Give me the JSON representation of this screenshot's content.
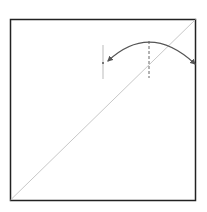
{
  "diagram": {
    "frame": {
      "x": 10.5,
      "y": 19.5,
      "width": 185,
      "height": 181,
      "stroke": "#222222"
    },
    "diagonal": {
      "x1": 10.5,
      "y1": 200,
      "x2": 195.5,
      "y2": 19.5,
      "stroke": "#c8c8c8"
    },
    "arc": {
      "path": "M108,61 Q150,22 195,64",
      "stroke": "#555555"
    },
    "tick_line": {
      "x": 103,
      "y1": 45,
      "y2": 79,
      "stroke": "#bbbbbb"
    },
    "dashed_line": {
      "x": 149,
      "y1": 41,
      "y2": 78,
      "stroke": "#666666"
    },
    "colors": {
      "background": "#ffffff"
    }
  }
}
